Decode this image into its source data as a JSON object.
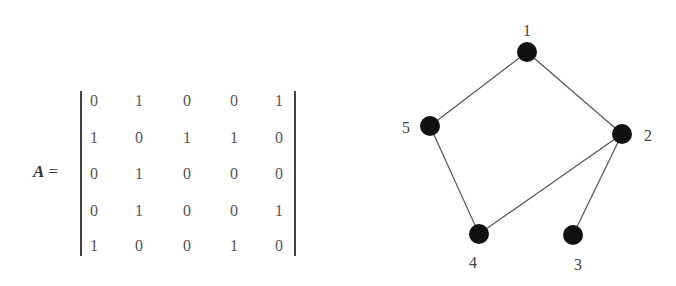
{
  "matrix": {
    "name": "A",
    "equals": "=",
    "rows": [
      [
        0,
        1,
        0,
        0,
        1
      ],
      [
        1,
        0,
        1,
        1,
        0
      ],
      [
        0,
        1,
        0,
        0,
        0
      ],
      [
        0,
        1,
        0,
        0,
        1
      ],
      [
        1,
        0,
        0,
        1,
        0
      ]
    ]
  },
  "graph": {
    "nodes": [
      {
        "id": "1",
        "x": 527,
        "y": 52,
        "lx": 527,
        "ly": 36
      },
      {
        "id": "2",
        "x": 622,
        "y": 134,
        "lx": 648,
        "ly": 141
      },
      {
        "id": "3",
        "x": 573,
        "y": 235,
        "lx": 578,
        "ly": 270
      },
      {
        "id": "4",
        "x": 479,
        "y": 234,
        "lx": 473,
        "ly": 268
      },
      {
        "id": "5",
        "x": 430,
        "y": 126,
        "lx": 406,
        "ly": 133
      }
    ],
    "edges": [
      [
        "1",
        "5"
      ],
      [
        "1",
        "2"
      ],
      [
        "5",
        "4"
      ],
      [
        "4",
        "2"
      ],
      [
        "2",
        "3"
      ]
    ],
    "node_color": "#111111",
    "edge_color": "#555555"
  }
}
